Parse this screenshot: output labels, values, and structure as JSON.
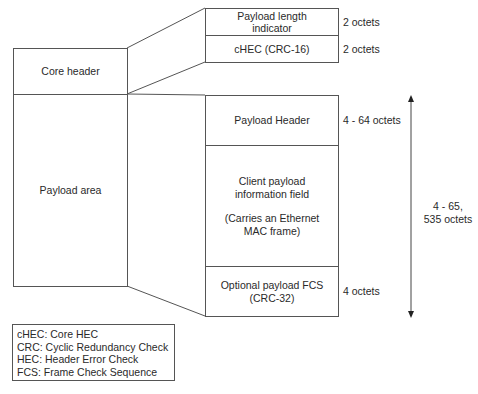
{
  "frame": {
    "left": {
      "core_header": "Core header",
      "payload_area": "Payload area"
    },
    "core_header_fields": [
      {
        "label_line1": "Payload length",
        "label_line2": "indicator",
        "size": "2 octets"
      },
      {
        "label_line1": "cHEC (CRC-16)",
        "label_line2": "",
        "size": "2 octets"
      }
    ],
    "payload_fields": [
      {
        "label_line1": "Payload Header",
        "size": "4 - 64 octets"
      },
      {
        "label_line1": "Client payload",
        "label_line2": "information field",
        "label_line3": "(Carries an Ethernet",
        "label_line4": "MAC frame)",
        "size": ""
      },
      {
        "label_line1": "Optional payload FCS",
        "label_line2": "(CRC-32)",
        "size": "4 octets"
      }
    ],
    "total_range": {
      "line1": "4 - 65,",
      "line2": "535 octets"
    }
  },
  "legend": [
    "cHEC: Core HEC",
    "CRC: Cyclic Redundancy Check",
    "HEC: Header Error Check",
    "FCS: Frame Check Sequence"
  ],
  "colors": {
    "line": "#555555",
    "text": "#2a2a2a",
    "background": "#ffffff"
  }
}
